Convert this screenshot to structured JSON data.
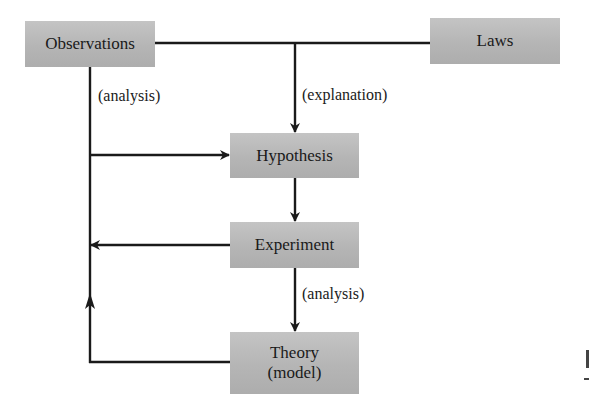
{
  "diagram": {
    "type": "flowchart",
    "title": "",
    "nodes": [
      {
        "id": "observations",
        "label": "Observations"
      },
      {
        "id": "laws",
        "label": "Laws"
      },
      {
        "id": "hypothesis",
        "label": "Hypothesis"
      },
      {
        "id": "experiment",
        "label": "Experiment"
      },
      {
        "id": "theory",
        "label": "Theory",
        "sublabel": "(model)"
      }
    ],
    "edge_labels": {
      "observations_analysis": "(analysis)",
      "explanation": "(explanation)",
      "experiment_analysis": "(analysis)"
    },
    "edges": [
      {
        "from": "observations",
        "to": "hypothesis",
        "label": "(analysis)"
      },
      {
        "from": "observations",
        "to": "hypothesis",
        "label": "(explanation)",
        "via": "top connector"
      },
      {
        "from": "laws",
        "to": "hypothesis",
        "label": "(explanation)"
      },
      {
        "from": "hypothesis",
        "to": "experiment",
        "label": ""
      },
      {
        "from": "experiment",
        "to": "observations",
        "label": ""
      },
      {
        "from": "experiment",
        "to": "theory",
        "label": "(analysis)"
      },
      {
        "from": "theory",
        "to": "observations",
        "label": ""
      }
    ],
    "colors": {
      "box_fill": "#b8b8b8",
      "line": "#1a1a1a",
      "background": "#ffffff"
    }
  }
}
